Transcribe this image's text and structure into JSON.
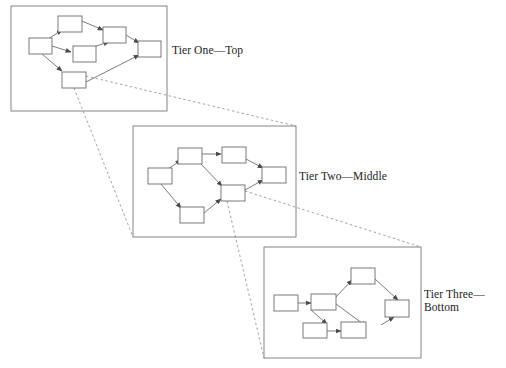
{
  "figure": {
    "type": "multi-level-graph-zoom-diagram",
    "background_color": "#ffffff",
    "stroke_color": "#555555",
    "node_fill": "#ffffff",
    "text_color": "#1a1a1a",
    "width": 506,
    "height": 368
  },
  "tiers": [
    {
      "id": "tier-one",
      "label": "Tier One—Top",
      "box": {
        "x": 11,
        "y": 6,
        "w": 156,
        "h": 105
      },
      "nodes": [
        {
          "id": "t1-left",
          "x": 29,
          "y": 38,
          "w": 23,
          "h": 16
        },
        {
          "id": "t1-top",
          "x": 58,
          "y": 16,
          "w": 24,
          "h": 16
        },
        {
          "id": "t1-upper",
          "x": 103,
          "y": 27,
          "w": 23,
          "h": 16
        },
        {
          "id": "t1-mid",
          "x": 73,
          "y": 46,
          "w": 23,
          "h": 16
        },
        {
          "id": "t1-right",
          "x": 138,
          "y": 41,
          "w": 23,
          "h": 16
        },
        {
          "id": "t1-bottom",
          "x": 62,
          "y": 72,
          "w": 24,
          "h": 16
        }
      ],
      "edges": [
        {
          "from": "t1-left",
          "to": "t1-top"
        },
        {
          "from": "t1-left",
          "to": "t1-mid"
        },
        {
          "from": "t1-left",
          "to": "t1-bottom"
        },
        {
          "from": "t1-top",
          "to": "t1-upper"
        },
        {
          "from": "t1-mid",
          "to": "t1-upper"
        },
        {
          "from": "t1-upper",
          "to": "t1-right"
        },
        {
          "from": "t1-bottom",
          "to": "t1-right"
        }
      ]
    },
    {
      "id": "tier-two",
      "label": "Tier Two—Middle",
      "box": {
        "x": 133,
        "y": 126,
        "w": 163,
        "h": 111
      },
      "nodes": [
        {
          "id": "t2-left",
          "x": 148,
          "y": 168,
          "w": 24,
          "h": 16
        },
        {
          "id": "t2-top",
          "x": 178,
          "y": 148,
          "w": 24,
          "h": 16
        },
        {
          "id": "t2-upper",
          "x": 222,
          "y": 147,
          "w": 24,
          "h": 16
        },
        {
          "id": "t2-mid",
          "x": 221,
          "y": 185,
          "w": 24,
          "h": 16
        },
        {
          "id": "t2-right",
          "x": 262,
          "y": 167,
          "w": 24,
          "h": 16
        },
        {
          "id": "t2-bottom",
          "x": 180,
          "y": 207,
          "w": 24,
          "h": 16
        }
      ],
      "edges": [
        {
          "from": "t2-left",
          "to": "t2-top"
        },
        {
          "from": "t2-left",
          "to": "t2-bottom"
        },
        {
          "from": "t2-top",
          "to": "t2-upper"
        },
        {
          "from": "t2-top",
          "to": "t2-mid"
        },
        {
          "from": "t2-bottom",
          "to": "t2-mid"
        },
        {
          "from": "t2-upper",
          "to": "t2-right"
        },
        {
          "from": "t2-mid",
          "to": "t2-right"
        }
      ]
    },
    {
      "id": "tier-three",
      "label": "Tier Three—Bottom",
      "box": {
        "x": 264,
        "y": 247,
        "w": 157,
        "h": 111
      },
      "nodes": [
        {
          "id": "t3-left",
          "x": 274,
          "y": 295,
          "w": 24,
          "h": 16
        },
        {
          "id": "t3-second",
          "x": 311,
          "y": 294,
          "w": 25,
          "h": 16
        },
        {
          "id": "t3-top",
          "x": 351,
          "y": 268,
          "w": 24,
          "h": 16
        },
        {
          "id": "t3-low",
          "x": 341,
          "y": 322,
          "w": 25,
          "h": 16
        },
        {
          "id": "t3-lowmid",
          "x": 303,
          "y": 323,
          "w": 24,
          "h": 15
        },
        {
          "id": "t3-right",
          "x": 385,
          "y": 300,
          "w": 24,
          "h": 17
        }
      ],
      "edges": [
        {
          "from": "t3-left",
          "to": "t3-second"
        },
        {
          "from": "t3-second",
          "to": "t3-top"
        },
        {
          "from": "t3-second",
          "to": "t3-low"
        },
        {
          "from": "t3-left",
          "to": "t3-lowmid"
        },
        {
          "from": "t3-lowmid",
          "to": "t3-low"
        },
        {
          "from": "t3-top",
          "to": "t3-right"
        },
        {
          "from": "t3-low",
          "to": "t3-right"
        }
      ]
    }
  ],
  "zoom_connectors": [
    {
      "id": "connector-one-to-two",
      "from_node": "t1-bottom",
      "to_box": "tier-two",
      "style": "dashed"
    },
    {
      "id": "connector-two-to-three",
      "from_node": "t2-mid",
      "to_box": "tier-three",
      "style": "dashed"
    }
  ]
}
